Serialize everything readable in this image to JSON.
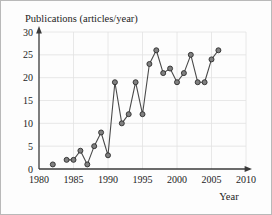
{
  "chart_data": {
    "type": "line",
    "title": "Publications (articles/year)",
    "xlabel": "Year",
    "ylabel": "Publications (articles/year)",
    "xlim": [
      1980,
      2010
    ],
    "ylim": [
      0,
      30
    ],
    "xticks": [
      1980,
      1985,
      1990,
      1995,
      2000,
      2005,
      2010
    ],
    "yticks": [
      0,
      5,
      10,
      15,
      20,
      25,
      30
    ],
    "xtick_labels": [
      "1980",
      "1985",
      "1990",
      "1995",
      "2000",
      "2005",
      "2010"
    ],
    "ytick_labels": [
      "0",
      "5",
      "10",
      "15",
      "20",
      "25",
      "30"
    ],
    "grid": true,
    "legend": false,
    "marker": "circle",
    "x": [
      1982,
      1984,
      1985,
      1986,
      1987,
      1988,
      1989,
      1990,
      1991,
      1992,
      1993,
      1994,
      1995,
      1996,
      1997,
      1998,
      1999,
      2000,
      2001,
      2002,
      2003,
      2004,
      2005,
      2006
    ],
    "values": [
      1,
      2,
      2,
      4,
      1,
      5,
      8,
      3,
      19,
      10,
      12,
      19,
      12,
      23,
      26,
      21,
      22,
      19,
      21,
      25,
      19,
      19,
      24,
      26
    ],
    "connected_from_index": 1,
    "colors": {
      "line": "#4a4a4a",
      "marker_fill": "#808080",
      "marker_edge": "#2c2c2c",
      "grid": "#e2e2e2",
      "axis": "#3a3a3a",
      "text": "#1c1c1c",
      "background": "#fdfdfd",
      "frame": "#b9b9b9"
    }
  }
}
